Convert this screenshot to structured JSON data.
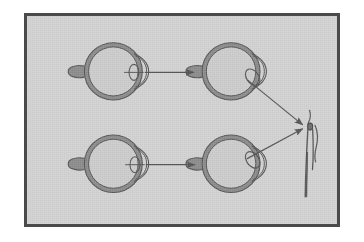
{
  "figure": {
    "title": "Eye accommodation diagram",
    "caption": "",
    "background_color": "#d2d2d2",
    "frame_color": "#4a4a4a",
    "page_color": "#ffffff",
    "ink_color": "#555555",
    "sclera_fill_color": "#8c8c8c",
    "interior_fill_color": "#cccccc",
    "frame": {
      "x": 24,
      "y": 13,
      "width": 316,
      "height": 214,
      "border_width": 3
    }
  },
  "eyes": [
    {
      "id": "eye-top-left",
      "label": "Relaxed eye, top row, left",
      "cx": 88,
      "cy": 70,
      "radius": 29,
      "lens": {
        "cx": 109,
        "cy": 71,
        "rx": 5,
        "ry": 8,
        "rotation_deg": 0
      },
      "optic_nerve_side": "left"
    },
    {
      "id": "eye-top-right",
      "label": "Accommodated eye, top row, right",
      "cx": 208,
      "cy": 70,
      "radius": 29,
      "lens": {
        "cx": 230,
        "cy": 76,
        "rx": 6,
        "ry": 9,
        "rotation_deg": -35
      },
      "optic_nerve_side": "left"
    },
    {
      "id": "eye-bottom-left",
      "label": "Relaxed eye, bottom row, left",
      "cx": 88,
      "cy": 165,
      "radius": 29,
      "lens": {
        "cx": 110,
        "cy": 166,
        "rx": 5,
        "ry": 8,
        "rotation_deg": 0
      },
      "optic_nerve_side": "left"
    },
    {
      "id": "eye-bottom-right",
      "label": "Accommodated eye, bottom row, right",
      "cx": 208,
      "cy": 165,
      "radius": 29,
      "lens": {
        "cx": 230,
        "cy": 161,
        "rx": 6,
        "ry": 9,
        "rotation_deg": -35
      },
      "optic_nerve_side": "left"
    }
  ],
  "arrows": [
    {
      "id": "arrow-top-transition",
      "label": "Top row transition arrow",
      "x1": 118,
      "y1": 71,
      "x2": 172,
      "y2": 71,
      "head": "end"
    },
    {
      "id": "arrow-bottom-transition",
      "label": "Bottom row transition arrow",
      "x1": 118,
      "y1": 166,
      "x2": 172,
      "y2": 166,
      "head": "end"
    },
    {
      "id": "arrow-top-to-object",
      "label": "Sight line from top-right eye to candle",
      "x1": 227,
      "y1": 79,
      "x2": 303,
      "y2": 126,
      "head": "end"
    },
    {
      "id": "arrow-bottom-to-object",
      "label": "Sight line from bottom-right eye to candle",
      "x1": 226,
      "y1": 160,
      "x2": 303,
      "y2": 128,
      "head": "end"
    }
  ],
  "object": {
    "id": "candle",
    "label": "Candle with flame",
    "x": 308,
    "flame_top_y": 100,
    "wick_y": 122,
    "base_y": 196
  }
}
